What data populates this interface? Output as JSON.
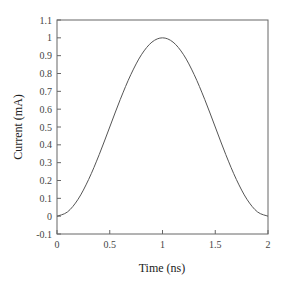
{
  "chart_data": {
    "type": "line",
    "title": "",
    "xlabel": "Time (ns)",
    "ylabel": "Current (mA)",
    "xlim": [
      0,
      2
    ],
    "ylim": [
      -0.1,
      1.1
    ],
    "xticks": [
      "0",
      "0.5",
      "1",
      "1.5",
      "2"
    ],
    "yticks": [
      "-0.1",
      "0",
      "0.1",
      "0.2",
      "0.3",
      "0.4",
      "0.5",
      "0.6",
      "0.7",
      "0.8",
      "0.9",
      "1",
      "1.1"
    ],
    "grid": false,
    "legend": null,
    "series": [
      {
        "name": "current",
        "color": "#555555",
        "x": [
          0,
          0.1,
          0.2,
          0.3,
          0.4,
          0.5,
          0.6,
          0.7,
          0.8,
          0.9,
          1.0,
          1.1,
          1.2,
          1.3,
          1.4,
          1.5,
          1.6,
          1.7,
          1.8,
          1.9,
          2.0
        ],
        "values": [
          0,
          0.024,
          0.095,
          0.206,
          0.345,
          0.5,
          0.655,
          0.794,
          0.905,
          0.976,
          1.0,
          0.976,
          0.905,
          0.794,
          0.655,
          0.5,
          0.345,
          0.206,
          0.095,
          0.024,
          0
        ]
      }
    ]
  },
  "layout": {
    "plot_left": 57,
    "plot_right": 268,
    "plot_top": 20,
    "plot_bottom": 234
  }
}
